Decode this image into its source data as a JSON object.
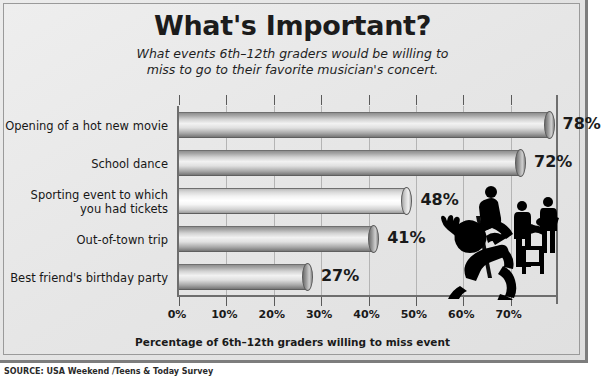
{
  "title": "What's Important?",
  "subtitle_line1": "What events 6th–12th graders would be willing to",
  "subtitle_line2": "miss to go to their favorite musician's concert.",
  "source": "SOURCE: USA Weekend /Teens & Today Survey",
  "colors": {
    "background": "#e6e6e6",
    "frame": "#7d7d7d",
    "bar_dark": "#8e8e8e",
    "bar_light": "#f2f2f2",
    "text": "#1a1a1a",
    "silhouette": "#000000"
  },
  "chart_data": {
    "type": "bar",
    "orientation": "horizontal",
    "title": "What's Important?",
    "subtitle": "What events 6th–12th graders would be willing to miss to go to their favorite musician's concert.",
    "xlabel": "Percentage of 6th–12th graders willing to miss event",
    "ylabel": "",
    "xlim": [
      0,
      80
    ],
    "xticks": [
      0,
      10,
      20,
      30,
      40,
      50,
      60,
      70
    ],
    "xtick_labels": [
      "0%",
      "10%",
      "20%",
      "30%",
      "40%",
      "50%",
      "60%",
      "70%"
    ],
    "grid": true,
    "legend": false,
    "categories": [
      "Opening of a hot new movie",
      "School dance",
      "Sporting event to which you had tickets",
      "Out-of-town trip",
      "Best friend's birthday party"
    ],
    "values": [
      78,
      72,
      48,
      41,
      27
    ],
    "value_labels": [
      "78%",
      "72%",
      "48%",
      "41%",
      "27%"
    ]
  },
  "bars": [
    {
      "label_line1": "Opening of a hot new movie",
      "label_line2": "",
      "value": 78,
      "value_label": "78%",
      "style": "dark"
    },
    {
      "label_line1": "School dance",
      "label_line2": "",
      "value": 72,
      "value_label": "72%",
      "style": "dark"
    },
    {
      "label_line1": "Sporting event to which",
      "label_line2": "you had tickets",
      "value": 48,
      "value_label": "48%",
      "style": "light"
    },
    {
      "label_line1": "Out-of-town trip",
      "label_line2": "",
      "value": 41,
      "value_label": "41%",
      "style": "dark"
    },
    {
      "label_line1": "Best friend's birthday party",
      "label_line2": "",
      "value": 27,
      "value_label": "27%",
      "style": "dark"
    }
  ],
  "xaxis": {
    "title": "Percentage of 6th–12th graders willing to miss event",
    "ticks": [
      "0%",
      "10%",
      "20%",
      "30%",
      "40%",
      "50%",
      "60%",
      "70%"
    ]
  },
  "illustration": {
    "name": "rock-band-silhouette",
    "description": "Silhouettes of a singer, guitarists and an amplifier"
  }
}
